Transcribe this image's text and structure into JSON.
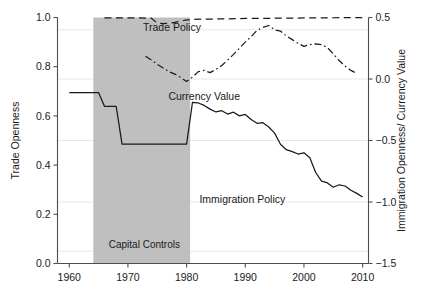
{
  "chart_data": {
    "type": "line",
    "title": "",
    "subtitle": "",
    "xlabel": "",
    "ylabel": "Trade Openness",
    "y2label": "Immigration Openness/ Currency Value",
    "xlim": [
      1958,
      2011
    ],
    "ylim": [
      0.0,
      1.0
    ],
    "y2lim": [
      -1.5,
      0.5
    ],
    "grid": true,
    "legend_position": "inline-annotations",
    "xticks": [
      1960,
      1970,
      1980,
      1990,
      2000,
      2010
    ],
    "xticklabels": [
      "1960",
      "1970",
      "1980",
      "1990",
      "2000",
      "2010"
    ],
    "yticks": [
      0.0,
      0.2,
      0.4,
      0.6,
      0.8,
      1.0
    ],
    "yticklabels": [
      "0.0",
      "0.2",
      "0.4",
      "0.6",
      "0.8",
      "1.0"
    ],
    "y2ticks": [
      -1.5,
      -1.0,
      -0.5,
      0.0,
      0.5
    ],
    "y2ticklabels": [
      "−1.5",
      "−1.0",
      "−0.5",
      "0.0",
      "0.5"
    ],
    "annotations": [
      {
        "text": "Trade Policy",
        "x": 1977.5,
        "y_left": 0.945,
        "name": "trade-policy-label"
      },
      {
        "text": "Currency Value",
        "x": 1983.0,
        "y_left": 0.665,
        "name": "currency-value-label"
      },
      {
        "text": "Immigration Policy",
        "x": 1989.5,
        "y_left": 0.245,
        "name": "immigration-policy-label"
      },
      {
        "text": "Capital Controls",
        "x": 1972.8,
        "y_left": 0.065,
        "name": "capital-controls-label"
      }
    ],
    "shaded_regions": [
      {
        "label": "Capital Controls",
        "x_start": 1964.1,
        "x_end": 1980.6,
        "color": "#bfbfbf",
        "axis": "left",
        "y_start": 0.0,
        "y_end": 1.0
      }
    ],
    "series": [
      {
        "name": "Trade Policy",
        "axis": "left",
        "style": "dashed",
        "color": "#1a1a1a",
        "x": [
          1966,
          1968,
          1970,
          1972,
          1974,
          1975,
          1976,
          1977,
          1978,
          1979,
          1980,
          1982,
          1985,
          1990,
          1995,
          2000,
          2005,
          2010
        ],
        "values": [
          0.999,
          0.999,
          0.998,
          0.998,
          0.997,
          0.977,
          0.975,
          0.976,
          0.98,
          0.985,
          0.99,
          0.993,
          0.994,
          0.996,
          0.997,
          0.998,
          0.999,
          1.0
        ]
      },
      {
        "name": "Currency Value",
        "axis": "right",
        "style": "dashdot",
        "color": "#1a1a1a",
        "x": [
          1973,
          1974,
          1975,
          1976,
          1977,
          1978,
          1979,
          1980,
          1981,
          1982,
          1983,
          1984,
          1985,
          1986,
          1987,
          1988,
          1989,
          1990,
          1991,
          1992,
          1993,
          1994,
          1995,
          1996,
          1997,
          1998,
          1999,
          2000,
          2001,
          2002,
          2003,
          2004,
          2005,
          2006,
          2007,
          2008,
          2009
        ],
        "values": [
          0.185,
          0.155,
          0.12,
          0.09,
          0.06,
          0.04,
          0.012,
          -0.02,
          0.015,
          0.06,
          0.07,
          0.052,
          0.078,
          0.11,
          0.155,
          0.2,
          0.25,
          0.3,
          0.345,
          0.395,
          0.42,
          0.435,
          0.4,
          0.39,
          0.35,
          0.32,
          0.29,
          0.265,
          0.28,
          0.285,
          0.28,
          0.255,
          0.205,
          0.15,
          0.105,
          0.07,
          0.045
        ]
      },
      {
        "name": "Immigration Policy",
        "axis": "right",
        "style": "solid",
        "color": "#1a1a1a",
        "x": [
          1960,
          1961,
          1962,
          1963,
          1964,
          1965,
          1966,
          1967,
          1968,
          1969,
          1970,
          1971,
          1972,
          1973,
          1974,
          1975,
          1976,
          1977,
          1978,
          1979,
          1980,
          1981,
          1982,
          1983,
          1984,
          1985,
          1986,
          1987,
          1988,
          1989,
          1990,
          1991,
          1992,
          1993,
          1994,
          1995,
          1996,
          1997,
          1998,
          1999,
          2000,
          2001,
          2002,
          2003,
          2004,
          2005,
          2006,
          2007,
          2008,
          2009,
          2010
        ],
        "values": [
          -0.11,
          -0.11,
          -0.11,
          -0.11,
          -0.11,
          -0.11,
          -0.222,
          -0.222,
          -0.222,
          -0.53,
          -0.53,
          -0.53,
          -0.53,
          -0.53,
          -0.53,
          -0.53,
          -0.53,
          -0.53,
          -0.53,
          -0.53,
          -0.53,
          -0.19,
          -0.195,
          -0.215,
          -0.245,
          -0.268,
          -0.258,
          -0.285,
          -0.27,
          -0.3,
          -0.288,
          -0.33,
          -0.36,
          -0.355,
          -0.39,
          -0.44,
          -0.53,
          -0.575,
          -0.59,
          -0.61,
          -0.6,
          -0.64,
          -0.76,
          -0.83,
          -0.845,
          -0.88,
          -0.86,
          -0.87,
          -0.905,
          -0.93,
          -0.96
        ]
      }
    ]
  },
  "figure": {
    "background": "#ffffff",
    "grid_color": "#e8e8e8",
    "axis_color": "#4d4d4d",
    "shade_color": "#bfbfbf",
    "line_color": "#1a1a1a"
  }
}
